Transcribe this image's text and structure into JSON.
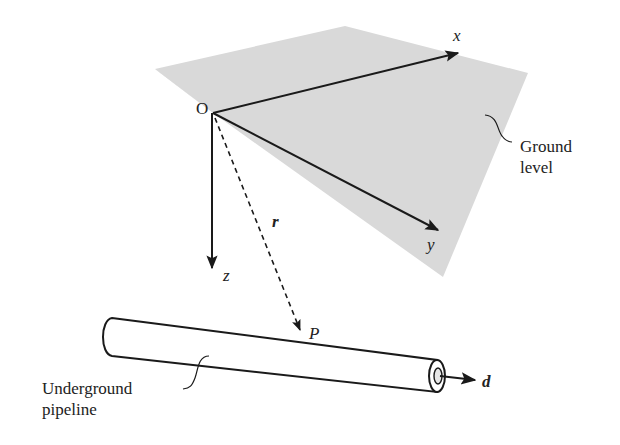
{
  "figure": {
    "colors": {
      "ground_plane": "#d9d9d9",
      "lines": "#1a1a1a",
      "text": "#222222",
      "background": "#ffffff"
    },
    "origin": {
      "label": "O"
    },
    "axes": {
      "x": {
        "label": "x"
      },
      "y": {
        "label": "y"
      },
      "z": {
        "label": "z"
      }
    },
    "position_vector": {
      "label": "r",
      "style": "dashed"
    },
    "point": {
      "label": "P"
    },
    "direction_vector": {
      "label": "d"
    },
    "ground_label": "Ground\nlevel",
    "pipeline_label": "Underground\npipeline"
  }
}
